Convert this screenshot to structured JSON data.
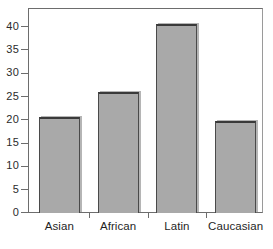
{
  "chart_data": {
    "type": "bar",
    "title": "",
    "subtitle": "",
    "xlabel": "",
    "ylabel": "",
    "categories": [
      "Asian",
      "African",
      "Latin",
      "Caucasian"
    ],
    "values": [
      20.5,
      26.0,
      40.5,
      19.8
    ],
    "series": [
      {
        "name": "",
        "values": [
          20.5,
          26.0,
          40.5,
          19.8
        ]
      }
    ],
    "ylim": [
      0,
      44
    ],
    "yticks": [
      0,
      5,
      10,
      15,
      20,
      25,
      30,
      35,
      40
    ],
    "ytick_labels": [
      "0",
      "5",
      "10",
      "15",
      "20",
      "25",
      "30",
      "35",
      "40"
    ],
    "grid": false,
    "legend": false,
    "legend_position": "none",
    "annotations": [],
    "bar_color": "#a9a9a9",
    "bar_edge_color": "#3a3a3a",
    "axis_color": "#6d6d6d",
    "background_color": "#ffffff"
  }
}
